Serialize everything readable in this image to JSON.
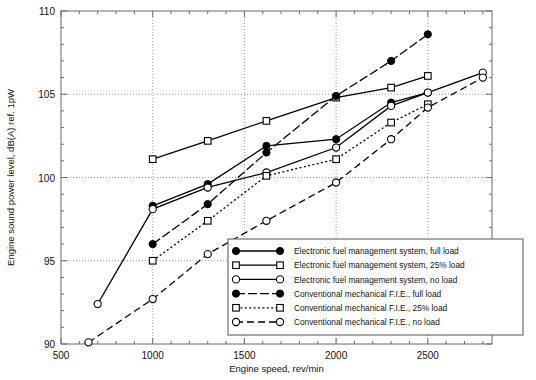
{
  "chart_data": {
    "type": "line",
    "title": "",
    "xlabel": "Engine speed, rev/min",
    "ylabel": "Engine sound power level, dB(A) ref. 1pW",
    "xlim": [
      500,
      2850
    ],
    "ylim": [
      90,
      110
    ],
    "xticks": [
      500,
      1000,
      1500,
      2000,
      2500
    ],
    "yticks": [
      90,
      95,
      100,
      105,
      110
    ],
    "xtick_labels": [
      "500",
      "1000",
      "1500",
      "2000",
      "2500"
    ],
    "ytick_labels": [
      "90",
      "95",
      "100",
      "105",
      "110"
    ],
    "grid": true,
    "grid_style": "dotted",
    "legend_position": "lower right",
    "series": [
      {
        "name": "Electronic fuel management system, full load",
        "marker": "filled-circle",
        "line": "solid",
        "x": [
          1000,
          1300,
          1620,
          2000,
          2300,
          2500
        ],
        "y": [
          98.3,
          99.6,
          101.9,
          102.3,
          104.5,
          105.1
        ]
      },
      {
        "name": "Electronic fuel management system, 25% load",
        "marker": "open-square",
        "line": "solid",
        "x": [
          1000,
          1300,
          1620,
          2000,
          2300,
          2500
        ],
        "y": [
          101.1,
          102.2,
          103.4,
          104.8,
          105.4,
          106.1
        ]
      },
      {
        "name": "Electronic fuel management system, no load",
        "marker": "open-circle",
        "line": "solid",
        "x": [
          700,
          1000,
          1300,
          1620,
          2000,
          2300,
          2500,
          2800
        ],
        "y": [
          92.4,
          98.1,
          99.4,
          100.3,
          101.8,
          104.3,
          105.1,
          106.3
        ]
      },
      {
        "name": "Conventional mechanical F.I.E., full load",
        "marker": "filled-circle",
        "line": "dashdot",
        "x": [
          1000,
          1300,
          1620,
          2000,
          2300,
          2500
        ],
        "y": [
          96.0,
          98.4,
          101.5,
          104.9,
          107.0,
          108.6
        ]
      },
      {
        "name": "Conventional mechanical F.I.E., 25% load",
        "marker": "open-square",
        "line": "dotted",
        "x": [
          1000,
          1300,
          1620,
          2000,
          2300,
          2500
        ],
        "y": [
          95.0,
          97.4,
          100.1,
          101.1,
          103.3,
          104.4
        ]
      },
      {
        "name": "Conventional mechanical F.I.E., no load",
        "marker": "open-circle",
        "line": "dashed",
        "x": [
          650,
          1000,
          1300,
          1620,
          2000,
          2300,
          2500,
          2800
        ],
        "y": [
          90.1,
          92.7,
          95.4,
          97.4,
          99.7,
          102.3,
          104.2,
          106.0
        ]
      }
    ]
  },
  "legend": {
    "items": [
      {
        "label": "Electronic fuel management system, full load"
      },
      {
        "label": "Electronic fuel management system, 25% load"
      },
      {
        "label": "Electronic fuel management system, no load"
      },
      {
        "label": "Conventional mechanical F.I.E., full load"
      },
      {
        "label": "Conventional mechanical F.I.E., 25% load"
      },
      {
        "label": "Conventional mechanical F.I.E., no load"
      }
    ]
  },
  "colors": {
    "ink": "#000000",
    "axis": "#6b6b6b",
    "grid": "#9a9a9a",
    "background": "#ffffff"
  }
}
